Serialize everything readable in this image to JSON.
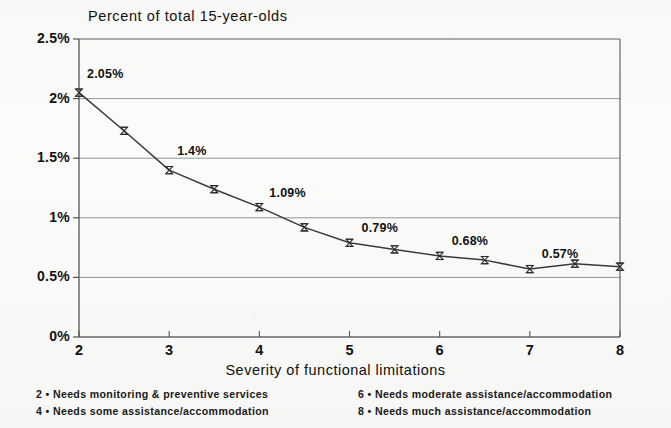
{
  "chart_data": {
    "type": "line",
    "title": "Percent of total 15-year-olds",
    "xlabel": "Severity of functional limitations",
    "ylabel": "",
    "xlim": [
      2,
      8
    ],
    "ylim": [
      0,
      2.5
    ],
    "grid": true,
    "legend_position": "below-axis",
    "x": [
      2,
      2.5,
      3,
      3.5,
      4,
      4.5,
      5,
      5.5,
      6,
      6.5,
      7,
      7.5,
      8
    ],
    "values": [
      2.05,
      1.73,
      1.4,
      1.24,
      1.09,
      0.92,
      0.79,
      0.735,
      0.68,
      0.645,
      0.57,
      0.615,
      0.59
    ],
    "series": [
      {
        "name": "Percent of total 15-year-olds",
        "values": [
          2.05,
          1.73,
          1.4,
          1.24,
          1.09,
          0.92,
          0.79,
          0.735,
          0.68,
          0.645,
          0.57,
          0.615,
          0.59
        ]
      }
    ],
    "xticks": [
      "2",
      "3",
      "4",
      "5",
      "6",
      "7",
      "8"
    ],
    "xtick_values": [
      2,
      3,
      4,
      5,
      6,
      7,
      8
    ],
    "yticks": [
      "0%",
      "0.5%",
      "1%",
      "1.5%",
      "2%",
      "2.5%"
    ],
    "ytick_values": [
      0,
      0.5,
      1,
      1.5,
      2,
      2.5
    ],
    "point_labels": [
      {
        "x": 2,
        "y": 2.05,
        "text": "2.05%"
      },
      {
        "x": 3,
        "y": 1.4,
        "text": "1.4%"
      },
      {
        "x": 4,
        "y": 1.09,
        "text": "1.09%"
      },
      {
        "x": 5,
        "y": 0.79,
        "text": "0.79%"
      },
      {
        "x": 6,
        "y": 0.68,
        "text": "0.68%"
      },
      {
        "x": 7,
        "y": 0.57,
        "text": "0.57%"
      }
    ],
    "annotations": [
      "2 • Needs monitoring & preventive services",
      "4 • Needs some assistance/accommodation",
      "6 • Needs moderate assistance/accommodation",
      "8 • Needs much assistance/accommodation"
    ],
    "colors": {
      "line": "#3a3a3a",
      "marker": "#2b2b2b",
      "grid": "#8a8a8a",
      "axis": "#555555",
      "background": "#fbfbf9",
      "text": "#141414"
    }
  },
  "legend": {
    "entries": [
      {
        "code": "2",
        "bullet": "•",
        "text": "Needs monitoring & preventive services",
        "full": "2 • Needs monitoring & preventive services"
      },
      {
        "code": "4",
        "bullet": "•",
        "text": "Needs some assistance/accommodation",
        "full": "4 • Needs some assistance/accommodation"
      },
      {
        "code": "6",
        "bullet": "•",
        "text": "Needs moderate assistance/accommodation",
        "full": "6 • Needs moderate assistance/accommodation"
      },
      {
        "code": "8",
        "bullet": "•",
        "text": "Needs much assistance/accommodation",
        "full": "8 • Needs much assistance/accommodation"
      }
    ]
  }
}
